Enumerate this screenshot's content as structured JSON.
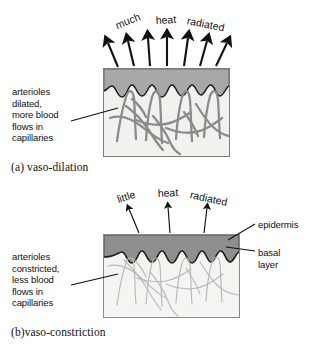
{
  "figure": {
    "background_color": "#ffffff",
    "ink_color": "#111111"
  },
  "panels": [
    {
      "id": "a",
      "caption": "(a)  vaso-dilation",
      "left_label": "arterioles\ndilated,\nmore blood\nflows in\ncapillaries",
      "heat_words": [
        "much",
        "heat",
        "radiated"
      ],
      "arrow_count": 7,
      "arrow_style": "thick",
      "state": "dilated",
      "colors": {
        "epidermis": "#a8a8a8",
        "dermis": "#f1f1ee",
        "capillary": "#8c8c8c",
        "outline": "#1c1c1c"
      }
    },
    {
      "id": "b",
      "caption": "(b)vaso-constriction",
      "left_label": "arterioles\nconstricted,\nless blood\nflows in\ncapillaries",
      "heat_words": [
        "little",
        "heat",
        "radiated"
      ],
      "arrow_count": 3,
      "arrow_style": "thin",
      "state": "constricted",
      "right_labels": [
        "epidermis",
        "basal\nlayer"
      ],
      "colors": {
        "epidermis": "#8f8f8f",
        "dermis": "#f4f4f1",
        "capillary": "#b9b9b9",
        "outline": "#1c1c1c"
      }
    }
  ]
}
